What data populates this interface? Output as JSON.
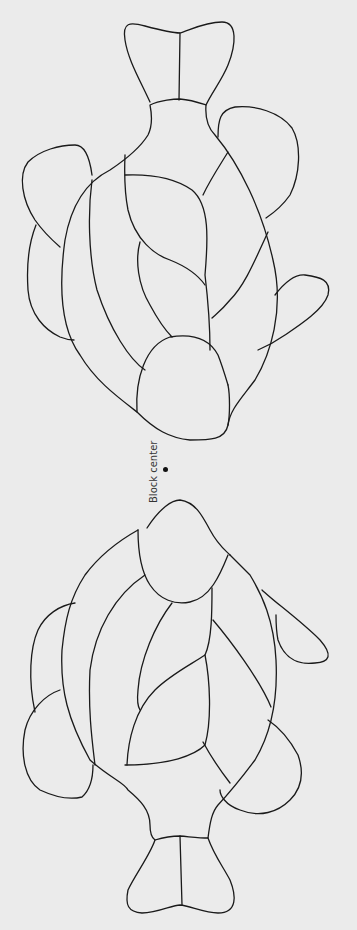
{
  "diagram": {
    "type": "stained-glass pattern",
    "block_center_label": "Block center",
    "stroke_color": "#1a1a1a",
    "background_color": "#ebebeb",
    "shapes": [
      {
        "name": "fish-top",
        "orientation": "tail up, head toward center"
      },
      {
        "name": "fish-bottom",
        "orientation": "head toward center, tail down"
      }
    ]
  }
}
